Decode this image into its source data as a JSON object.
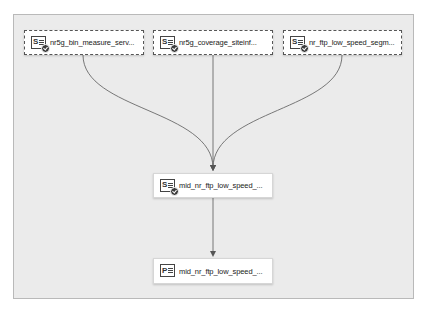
{
  "diagram": {
    "type": "data-lineage-flow",
    "nodes": [
      {
        "id": "n1",
        "label": "nr5g_bin_measure_serv...",
        "icon": "table-s-icon",
        "status": "check-badge",
        "border": "dashed"
      },
      {
        "id": "n2",
        "label": "nr5g_coverage_siteinf...",
        "icon": "table-s-icon",
        "status": "check-badge",
        "border": "dashed"
      },
      {
        "id": "n3",
        "label": "nr_ftp_low_speed_segm...",
        "icon": "table-s-icon",
        "status": "check-badge",
        "border": "dashed"
      },
      {
        "id": "n4",
        "label": "mid_nr_ftp_low_speed_...",
        "icon": "table-s-icon",
        "status": "check-badge",
        "border": "solid"
      },
      {
        "id": "n5",
        "label": "mid_nr_ftp_low_speed_...",
        "icon": "table-p-icon",
        "status": null,
        "border": "solid"
      }
    ],
    "edges": [
      {
        "from": "n1",
        "to": "n4"
      },
      {
        "from": "n2",
        "to": "n4"
      },
      {
        "from": "n3",
        "to": "n4"
      },
      {
        "from": "n4",
        "to": "n5"
      }
    ],
    "icon_letters": {
      "s": "S",
      "p": "P"
    },
    "colors": {
      "canvas": "#ebebeb",
      "edge": "#666666",
      "node_bg": "#ffffff",
      "badge": "#3c3c3c"
    }
  }
}
